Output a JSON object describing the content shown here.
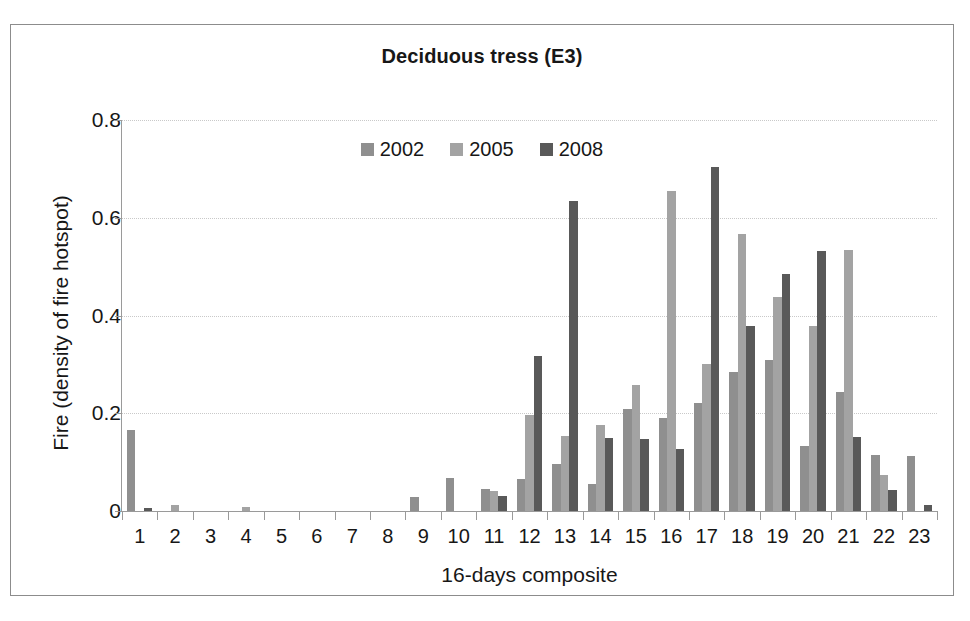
{
  "figure": {
    "title": "Deciduous tress (E3)"
  },
  "chart_data": {
    "type": "bar",
    "title": "Deciduous tress (E3)",
    "xlabel": "16-days composite",
    "ylabel": "Fire (density of fire hotspot)",
    "ylim": [
      0,
      0.8
    ],
    "yticks": [
      0,
      0.2,
      0.4,
      0.6,
      0.8
    ],
    "ytick_labels": [
      "0",
      "0.2",
      "0.4",
      "0.6",
      "0.8"
    ],
    "grid": true,
    "legend_position": "top-center",
    "categories": [
      "1",
      "2",
      "3",
      "4",
      "5",
      "6",
      "7",
      "8",
      "9",
      "10",
      "11",
      "12",
      "13",
      "14",
      "15",
      "16",
      "17",
      "18",
      "19",
      "20",
      "21",
      "22",
      "23"
    ],
    "series": [
      {
        "name": "2002",
        "color": "#8f8f8f",
        "values": [
          0.165,
          0,
          0,
          0,
          0,
          0,
          0,
          0,
          0.028,
          0.068,
          0.046,
          0.065,
          0.097,
          0.056,
          0.208,
          0.19,
          0.222,
          0.285,
          0.308,
          0.134,
          0.243,
          0.114,
          0.113
        ]
      },
      {
        "name": "2005",
        "color": "#a3a3a3",
        "values": [
          0,
          0.012,
          0,
          0.009,
          0,
          0,
          0,
          0,
          0,
          0,
          0.041,
          0.196,
          0.153,
          0.176,
          0.258,
          0.655,
          0.3,
          0.567,
          0.437,
          0.379,
          0.535,
          0.074,
          0
        ]
      },
      {
        "name": "2008",
        "color": "#595959",
        "values": [
          0.007,
          0,
          0,
          0,
          0,
          0,
          0,
          0,
          0,
          0,
          0.03,
          0.317,
          0.634,
          0.15,
          0.148,
          0.127,
          0.703,
          0.378,
          0.484,
          0.532,
          0.152,
          0.044,
          0.012
        ]
      }
    ]
  },
  "legend": {
    "items": [
      {
        "label": "2002",
        "color": "#8f8f8f"
      },
      {
        "label": "2005",
        "color": "#a3a3a3"
      },
      {
        "label": "2008",
        "color": "#595959"
      }
    ]
  }
}
